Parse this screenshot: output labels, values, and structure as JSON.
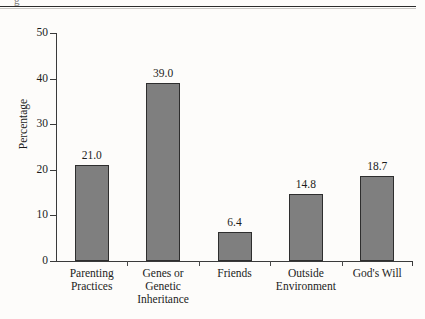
{
  "page": {
    "background_color": "#fdfcfa",
    "cropped_glyph_top_left": "g"
  },
  "chart_data": {
    "type": "bar",
    "title": "",
    "xlabel": "",
    "ylabel": "Percentage",
    "categories": [
      "Parenting Practices",
      "Genes or Genetic Inheritance",
      "Friends",
      "Outside Environment",
      "God's Will"
    ],
    "category_lines": [
      [
        "Parenting",
        "Practices"
      ],
      [
        "Genes or",
        "Genetic",
        "Inheritance"
      ],
      [
        "Friends"
      ],
      [
        "Outside",
        "Environment"
      ],
      [
        "God's Will"
      ]
    ],
    "values": [
      21.0,
      39.0,
      6.4,
      14.8,
      18.7
    ],
    "value_labels": [
      "21.0",
      "39.0",
      "6.4",
      "14.8",
      "18.7"
    ],
    "ylim": [
      0,
      50
    ],
    "yticks": [
      0,
      10,
      20,
      30,
      40,
      50
    ],
    "ytick_labels": [
      "0",
      "10",
      "20",
      "30",
      "40",
      "50"
    ],
    "grid": false,
    "legend": null,
    "bar_fill_color": "#7f7f7f",
    "bar_edge_color": "#2e2e2e",
    "axis_color": "#3a3a3a"
  }
}
